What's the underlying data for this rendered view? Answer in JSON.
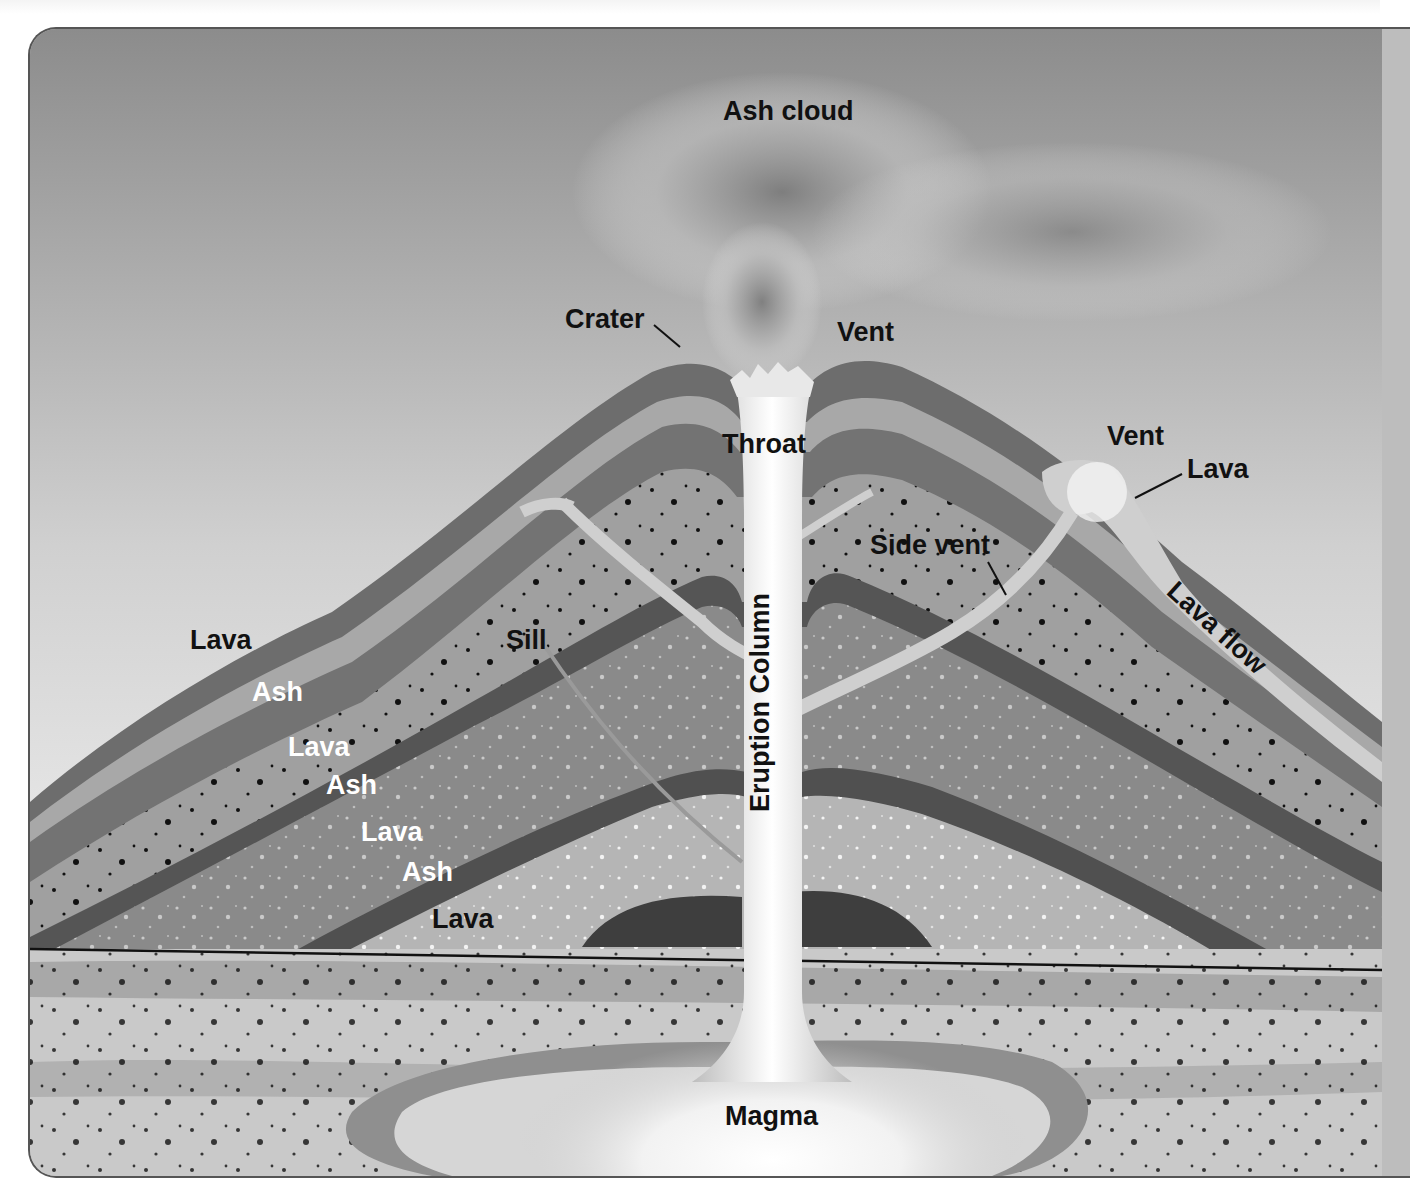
{
  "diagram": {
    "labels": {
      "ash_cloud": "Ash cloud",
      "crater": "Crater",
      "vent_top": "Vent",
      "throat": "Throat",
      "vent_side": "Vent",
      "lava_side": "Lava",
      "side_vent": "Side vent",
      "lava_flow": "Lava flow",
      "sill": "Sill",
      "eruption_column": "Eruption Column",
      "magma": "Magma",
      "strata_left": [
        "Lava",
        "Ash",
        "Lava",
        "Ash",
        "Lava",
        "Ash",
        "Lava"
      ]
    },
    "colors": {
      "sky_top": "#8e8e8e",
      "sky_bottom": "#e9e9e9",
      "lava_layer": "#6f6f6f",
      "ash_layer": "#a6a6a6",
      "dark_band": "#4e4e4e",
      "column": "#e6e6e6",
      "ground": "#c4c4c4"
    }
  }
}
